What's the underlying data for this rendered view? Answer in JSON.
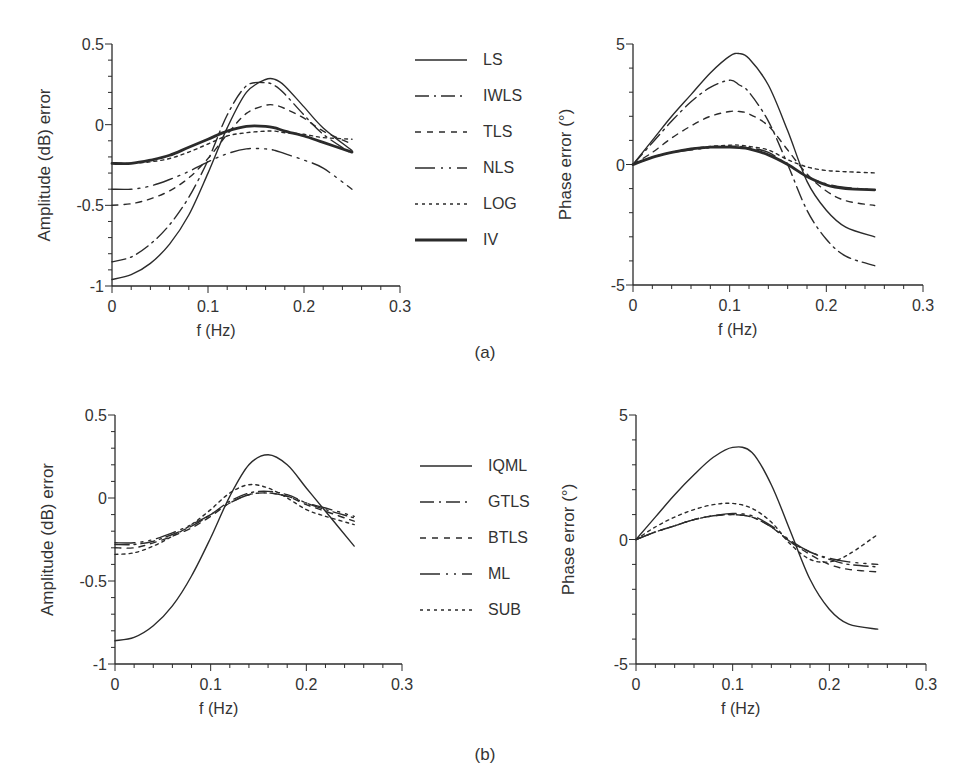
{
  "figure": {
    "panel_labels": [
      "(a)",
      "(b)"
    ],
    "line_color": "#2b2b2b"
  },
  "legends": [
    {
      "panel": "(a)",
      "entries": [
        {
          "label": "LS",
          "style": "solid"
        },
        {
          "label": "IWLS",
          "style": "dashdot"
        },
        {
          "label": "TLS",
          "style": "dash"
        },
        {
          "label": "NLS",
          "style": "longdashdot"
        },
        {
          "label": "LOG",
          "style": "dot"
        },
        {
          "label": "IV",
          "style": "thick"
        }
      ]
    },
    {
      "panel": "(b)",
      "entries": [
        {
          "label": "IQML",
          "style": "solid"
        },
        {
          "label": "GTLS",
          "style": "dashdot"
        },
        {
          "label": "BTLS",
          "style": "dash"
        },
        {
          "label": "ML",
          "style": "longdashdot"
        },
        {
          "label": "SUB",
          "style": "dot"
        }
      ]
    }
  ],
  "chart_data": [
    {
      "id": "a-amplitude",
      "panel": "(a)",
      "type": "line",
      "title": "",
      "xlabel": "f (Hz)",
      "ylabel": "Amplitude (dB) error",
      "xlim": [
        0,
        0.3
      ],
      "ylim": [
        -1,
        0.5
      ],
      "xticks": [
        "0",
        "0.1",
        "0.2",
        "0.3"
      ],
      "yticks": [
        "0.5",
        "0",
        "-0.5",
        "-1"
      ],
      "grid": false,
      "x": [
        0,
        0.02,
        0.04,
        0.06,
        0.08,
        0.1,
        0.12,
        0.14,
        0.16,
        0.17,
        0.18,
        0.2,
        0.22,
        0.25
      ],
      "series": [
        {
          "name": "LS",
          "style": "solid",
          "values": [
            -0.96,
            -0.93,
            -0.86,
            -0.74,
            -0.56,
            -0.3,
            -0.02,
            0.2,
            0.28,
            0.28,
            0.24,
            0.11,
            -0.02,
            -0.16
          ]
        },
        {
          "name": "IWLS",
          "style": "dashdot",
          "values": [
            -0.85,
            -0.82,
            -0.74,
            -0.62,
            -0.45,
            -0.22,
            0.06,
            0.24,
            0.26,
            0.24,
            0.19,
            0.06,
            -0.06,
            -0.18
          ]
        },
        {
          "name": "TLS",
          "style": "dash",
          "values": [
            -0.5,
            -0.49,
            -0.46,
            -0.41,
            -0.33,
            -0.21,
            -0.06,
            0.07,
            0.12,
            0.12,
            0.1,
            0.04,
            -0.04,
            -0.12
          ]
        },
        {
          "name": "NLS",
          "style": "longdashdot",
          "values": [
            -0.4,
            -0.4,
            -0.38,
            -0.34,
            -0.29,
            -0.23,
            -0.18,
            -0.15,
            -0.15,
            -0.16,
            -0.18,
            -0.22,
            -0.27,
            -0.4
          ]
        },
        {
          "name": "LOG",
          "style": "dot",
          "values": [
            -0.24,
            -0.24,
            -0.23,
            -0.21,
            -0.17,
            -0.12,
            -0.07,
            -0.05,
            -0.04,
            -0.04,
            -0.05,
            -0.06,
            -0.08,
            -0.09
          ]
        },
        {
          "name": "IV",
          "style": "thick",
          "values": [
            -0.24,
            -0.24,
            -0.22,
            -0.19,
            -0.14,
            -0.09,
            -0.04,
            -0.01,
            -0.01,
            -0.02,
            -0.04,
            -0.07,
            -0.11,
            -0.17
          ]
        }
      ]
    },
    {
      "id": "a-phase",
      "panel": "(a)",
      "type": "line",
      "title": "",
      "xlabel": "f (Hz)",
      "ylabel": "Phase error (°)",
      "xlim": [
        0,
        0.3
      ],
      "ylim": [
        -5,
        5
      ],
      "xticks": [
        "0",
        "0.1",
        "0.2",
        "0.3"
      ],
      "yticks": [
        "5",
        "0",
        "-5"
      ],
      "grid": false,
      "x": [
        0,
        0.02,
        0.04,
        0.06,
        0.08,
        0.1,
        0.11,
        0.12,
        0.14,
        0.16,
        0.18,
        0.2,
        0.22,
        0.25
      ],
      "series": [
        {
          "name": "LS",
          "style": "solid",
          "values": [
            0,
            1.0,
            2.0,
            2.9,
            3.8,
            4.5,
            4.6,
            4.4,
            3.3,
            1.4,
            -0.7,
            -1.9,
            -2.6,
            -3.0
          ]
        },
        {
          "name": "IWLS",
          "style": "dashdot",
          "values": [
            0,
            0.9,
            1.8,
            2.6,
            3.2,
            3.5,
            3.3,
            3.0,
            1.8,
            0.0,
            -1.9,
            -3.1,
            -3.8,
            -4.2
          ]
        },
        {
          "name": "TLS",
          "style": "dash",
          "values": [
            0,
            0.5,
            1.1,
            1.6,
            2.0,
            2.2,
            2.2,
            2.1,
            1.6,
            0.6,
            -0.4,
            -1.1,
            -1.5,
            -1.7
          ]
        },
        {
          "name": "NLS",
          "style": "longdashdot",
          "values": [
            0,
            0.3,
            0.5,
            0.6,
            0.7,
            0.75,
            0.75,
            0.7,
            0.5,
            0.0,
            -0.5,
            -0.8,
            -0.95,
            -1.05
          ]
        },
        {
          "name": "LOG",
          "style": "dot",
          "values": [
            0,
            0.3,
            0.5,
            0.65,
            0.75,
            0.8,
            0.8,
            0.75,
            0.6,
            0.2,
            -0.1,
            -0.25,
            -0.3,
            -0.35
          ]
        },
        {
          "name": "IV",
          "style": "thick",
          "values": [
            0,
            0.3,
            0.5,
            0.65,
            0.72,
            0.72,
            0.7,
            0.65,
            0.4,
            0.0,
            -0.5,
            -0.85,
            -1.0,
            -1.05
          ]
        }
      ]
    },
    {
      "id": "b-amplitude",
      "panel": "(b)",
      "type": "line",
      "title": "",
      "xlabel": "f (Hz)",
      "ylabel": "Amplitude (dB) error",
      "xlim": [
        0,
        0.3
      ],
      "ylim": [
        -1,
        0.5
      ],
      "xticks": [
        "0",
        "0.1",
        "0.2",
        "0.3"
      ],
      "yticks": [
        "0.5",
        "0",
        "-0.5",
        "-1"
      ],
      "grid": false,
      "x": [
        0,
        0.02,
        0.04,
        0.06,
        0.08,
        0.1,
        0.12,
        0.14,
        0.16,
        0.18,
        0.2,
        0.22,
        0.25
      ],
      "series": [
        {
          "name": "IQML",
          "style": "solid",
          "values": [
            -0.86,
            -0.84,
            -0.77,
            -0.65,
            -0.47,
            -0.24,
            0.01,
            0.2,
            0.26,
            0.2,
            0.06,
            -0.08,
            -0.29
          ]
        },
        {
          "name": "GTLS",
          "style": "dashdot",
          "values": [
            -0.28,
            -0.28,
            -0.26,
            -0.22,
            -0.17,
            -0.1,
            -0.02,
            0.03,
            0.04,
            0.02,
            -0.03,
            -0.07,
            -0.12
          ]
        },
        {
          "name": "BTLS",
          "style": "dash",
          "values": [
            -0.3,
            -0.3,
            -0.27,
            -0.23,
            -0.18,
            -0.11,
            -0.03,
            0.02,
            0.03,
            0.01,
            -0.04,
            -0.08,
            -0.14
          ]
        },
        {
          "name": "ML",
          "style": "longdashdot",
          "values": [
            -0.27,
            -0.27,
            -0.25,
            -0.21,
            -0.16,
            -0.1,
            -0.03,
            0.02,
            0.03,
            0.01,
            -0.03,
            -0.06,
            -0.11
          ]
        },
        {
          "name": "SUB",
          "style": "dot",
          "values": [
            -0.34,
            -0.33,
            -0.29,
            -0.23,
            -0.16,
            -0.07,
            0.03,
            0.08,
            0.06,
            0.0,
            -0.07,
            -0.11,
            -0.16
          ]
        }
      ]
    },
    {
      "id": "b-phase",
      "panel": "(b)",
      "type": "line",
      "title": "",
      "xlabel": "f (Hz)",
      "ylabel": "Phase error (°)",
      "xlim": [
        0,
        0.3
      ],
      "ylim": [
        -5,
        5
      ],
      "xticks": [
        "0",
        "0.1",
        "0.2",
        "0.3"
      ],
      "yticks": [
        "5",
        "0",
        "-5"
      ],
      "grid": false,
      "x": [
        0,
        0.02,
        0.04,
        0.06,
        0.08,
        0.1,
        0.12,
        0.14,
        0.16,
        0.18,
        0.2,
        0.22,
        0.25
      ],
      "series": [
        {
          "name": "IQML",
          "style": "solid",
          "values": [
            0,
            0.9,
            1.8,
            2.6,
            3.3,
            3.7,
            3.5,
            2.2,
            0.3,
            -1.6,
            -2.8,
            -3.4,
            -3.6
          ]
        },
        {
          "name": "GTLS",
          "style": "dashdot",
          "values": [
            0,
            0.3,
            0.55,
            0.8,
            0.95,
            1.0,
            0.9,
            0.5,
            -0.1,
            -0.5,
            -0.8,
            -1.0,
            -1.1
          ]
        },
        {
          "name": "BTLS",
          "style": "dash",
          "values": [
            0,
            0.3,
            0.55,
            0.8,
            0.95,
            1.0,
            0.9,
            0.5,
            -0.1,
            -0.6,
            -1.0,
            -1.2,
            -1.3
          ]
        },
        {
          "name": "ML",
          "style": "longdashdot",
          "values": [
            0,
            0.3,
            0.55,
            0.8,
            0.95,
            1.05,
            0.95,
            0.55,
            -0.05,
            -0.5,
            -0.75,
            -0.9,
            -1.0
          ]
        },
        {
          "name": "SUB",
          "style": "dot",
          "values": [
            0,
            0.5,
            0.9,
            1.2,
            1.4,
            1.45,
            1.25,
            0.7,
            -0.2,
            -0.8,
            -0.9,
            -0.6,
            0.2
          ]
        }
      ]
    }
  ]
}
